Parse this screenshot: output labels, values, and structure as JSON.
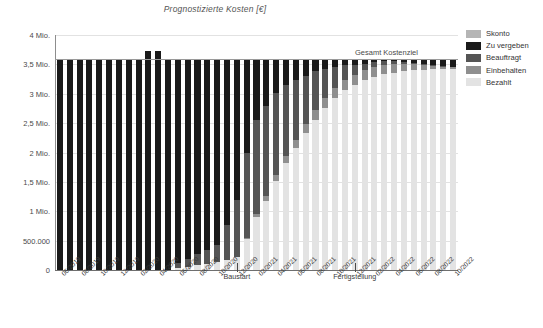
{
  "chart_data": {
    "type": "bar",
    "stacked": true,
    "title": "Prognostizierte Kosten [€]",
    "xlabel": "",
    "ylabel": "",
    "ylim": [
      0,
      4000000
    ],
    "grid": true,
    "legend_position": "right",
    "ytick_labels": [
      "4 Mio.",
      "3,5 Mio.",
      "3 Mio.",
      "2,5 Mio.",
      "2 Mio.",
      "1,5 Mio.",
      "1 Mio.",
      "500.000",
      "0"
    ],
    "ytick_values": [
      4000000,
      3500000,
      3000000,
      2500000,
      2000000,
      1500000,
      1000000,
      500000,
      0
    ],
    "categories": [
      "06/2019",
      "07/2019",
      "08/2019",
      "09/2019",
      "10/2019",
      "11/2019",
      "12/2019",
      "01/2020",
      "02/2020",
      "03/2020",
      "04/2020",
      "05/2020",
      "06/2020",
      "07/2020",
      "08/2020",
      "09/2020",
      "10/2020",
      "11/2020",
      "12/2020",
      "01/2021",
      "02/2021",
      "03/2021",
      "04/2021",
      "05/2021",
      "06/2021",
      "07/2021",
      "08/2021",
      "09/2021",
      "10/2021",
      "11/2021",
      "12/2021",
      "01/2022",
      "02/2022",
      "03/2022",
      "04/2022",
      "05/2022",
      "06/2022",
      "07/2022",
      "08/2022",
      "09/2022",
      "10/2022"
    ],
    "xtick_labels": [
      "06/2019",
      "08/2019",
      "10/2019",
      "12/2019",
      "02/2020",
      "04/2020",
      "06/2020",
      "08/2020",
      "10/2020",
      "12/2020",
      "02/2021",
      "04/2021",
      "06/2021",
      "08/2021",
      "10/2021",
      "12/2021",
      "02/2022",
      "04/2022",
      "06/2022",
      "08/2022",
      "10/2022"
    ],
    "series": [
      {
        "name": "Bezahlt",
        "color": "#e3e3e3",
        "values": [
          0,
          0,
          0,
          0,
          0,
          0,
          0,
          0,
          0,
          0,
          0,
          0,
          30000,
          55000,
          80000,
          105000,
          130000,
          170000,
          215000,
          520000,
          900000,
          1180000,
          1520000,
          1820000,
          2080000,
          2330000,
          2560000,
          2760000,
          2930000,
          3060000,
          3150000,
          3230000,
          3290000,
          3330000,
          3360000,
          3385000,
          3400000,
          3410000,
          3420000,
          3425000,
          3430000
        ]
      },
      {
        "name": "Einbehalten",
        "color": "#8f8f8f",
        "values": [
          0,
          0,
          0,
          0,
          0,
          0,
          0,
          0,
          0,
          0,
          0,
          0,
          0,
          0,
          0,
          0,
          0,
          0,
          0,
          30000,
          55000,
          80000,
          105000,
          125000,
          140000,
          150000,
          160000,
          165000,
          170000,
          172000,
          175000,
          175000,
          172000,
          165000,
          150000,
          130000,
          105000,
          80000,
          55000,
          35000,
          20000
        ]
      },
      {
        "name": "Beauftragt",
        "color": "#555555",
        "values": [
          0,
          0,
          0,
          0,
          0,
          0,
          0,
          0,
          0,
          0,
          0,
          0,
          90000,
          140000,
          190000,
          240000,
          300000,
          600000,
          980000,
          1450000,
          1600000,
          1530000,
          1380000,
          1200000,
          1010000,
          830000,
          660000,
          500000,
          360000,
          250000,
          170000,
          110000,
          75000,
          55000,
          40000,
          30000,
          25000,
          20000,
          18000,
          15000,
          12000
        ]
      },
      {
        "name": "Zu vergeben",
        "color": "#1a1a1a",
        "values": [
          3600000,
          3600000,
          3600000,
          3600000,
          3600000,
          3600000,
          3600000,
          3600000,
          3600000,
          3720000,
          3720000,
          3600000,
          3480000,
          3400000,
          3320000,
          3250000,
          3170000,
          2830000,
          2400000,
          1600000,
          1045000,
          810000,
          595000,
          455000,
          370000,
          290000,
          220000,
          175000,
          140000,
          118000,
          105000,
          85000,
          63000,
          50000,
          50000,
          55000,
          70000,
          90000,
          107000,
          125000,
          138000
        ]
      },
      {
        "name": "Skonto",
        "color": "#b5b5b5",
        "values": [
          0,
          0,
          0,
          0,
          0,
          0,
          0,
          0,
          0,
          0,
          0,
          0,
          0,
          0,
          0,
          0,
          0,
          0,
          0,
          0,
          0,
          0,
          0,
          0,
          0,
          0,
          0,
          0,
          0,
          0,
          0,
          0,
          0,
          0,
          0,
          0,
          0,
          0,
          0,
          0,
          0
        ]
      }
    ],
    "reference_line": {
      "label": "Gesamt Kostenziel",
      "value": 3600000,
      "color": "#9a9a9a"
    },
    "milestones": [
      {
        "label": "Baustart",
        "category_index": 18
      },
      {
        "label": "Fertigstellung",
        "category_index": 30
      }
    ]
  },
  "legend": {
    "items": [
      {
        "label": "Skonto",
        "color": "#b5b5b5"
      },
      {
        "label": "Zu vergeben",
        "color": "#1a1a1a"
      },
      {
        "label": "Beauftragt",
        "color": "#555555"
      },
      {
        "label": "Einbehalten",
        "color": "#8f8f8f"
      },
      {
        "label": "Bezahlt",
        "color": "#e3e3e3"
      }
    ]
  }
}
